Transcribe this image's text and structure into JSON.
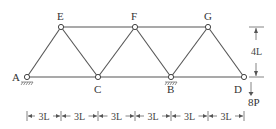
{
  "diagram": {
    "type": "truss",
    "nodes": [
      {
        "id": "A",
        "label": "A",
        "x": 27,
        "y": 77,
        "support": "pin"
      },
      {
        "id": "E",
        "label": "E",
        "x": 61,
        "y": 27
      },
      {
        "id": "C",
        "label": "C",
        "x": 98,
        "y": 77
      },
      {
        "id": "F",
        "label": "F",
        "x": 135,
        "y": 27
      },
      {
        "id": "B",
        "label": "B",
        "x": 171,
        "y": 77,
        "support": "pin"
      },
      {
        "id": "G",
        "label": "G",
        "x": 208,
        "y": 27
      },
      {
        "id": "D",
        "label": "D",
        "x": 244,
        "y": 77
      }
    ],
    "members": [
      [
        "A",
        "E"
      ],
      [
        "E",
        "C"
      ],
      [
        "C",
        "F"
      ],
      [
        "F",
        "B"
      ],
      [
        "B",
        "G"
      ],
      [
        "G",
        "D"
      ],
      [
        "A",
        "C"
      ],
      [
        "C",
        "B"
      ],
      [
        "B",
        "D"
      ],
      [
        "E",
        "F"
      ],
      [
        "F",
        "G"
      ]
    ],
    "load": {
      "node": "D",
      "label": "8P",
      "direction": "down"
    },
    "dimensions": {
      "horizontal": [
        "3L",
        "3L",
        "3L",
        "3L",
        "3L",
        "3L"
      ],
      "vertical": "4L"
    }
  }
}
